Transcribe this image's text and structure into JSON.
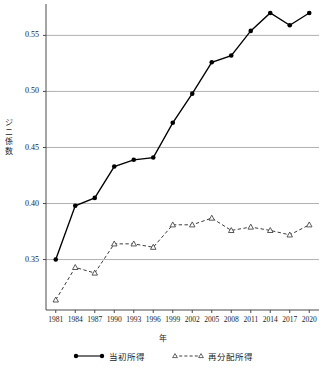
{
  "chart_data": {
    "type": "line",
    "title": "",
    "xlabel": "年",
    "ylabel": "ジニ係数",
    "ylabel_chars": [
      "ジ",
      "ニ",
      "係",
      "数"
    ],
    "categories": [
      "1981",
      "1984",
      "1987",
      "1990",
      "1993",
      "1996",
      "1999",
      "2002",
      "2005",
      "2008",
      "2011",
      "2014",
      "2017",
      "2020"
    ],
    "x_tick_labels": [
      "1981",
      "1984",
      "1987",
      "1990",
      "1993",
      "1996",
      "1999",
      "2002",
      "2005",
      "2008",
      "2011",
      "2014",
      "2017",
      "2020"
    ],
    "y_tick_labels": [
      "0.35",
      "0.40",
      "0.45",
      "0.50",
      "0.55"
    ],
    "y_tick_values": [
      0.35,
      0.4,
      0.45,
      0.5,
      0.55
    ],
    "ylim": [
      0.305,
      0.578
    ],
    "xlim": [
      1979.5,
      2021.5
    ],
    "grid": "horizontal",
    "legend_position": "bottom-center",
    "series": [
      {
        "name": "当初所得",
        "marker": "filled-circle",
        "linestyle": "solid",
        "color": "#000000",
        "values": [
          0.35,
          0.398,
          0.405,
          0.433,
          0.439,
          0.441,
          0.472,
          0.498,
          0.526,
          0.532,
          0.554,
          0.57,
          0.559,
          0.57
        ]
      },
      {
        "name": "再分配所得",
        "marker": "open-triangle",
        "linestyle": "dashed",
        "color": "#3c3c3c",
        "values": [
          0.314,
          0.343,
          0.338,
          0.364,
          0.364,
          0.361,
          0.381,
          0.381,
          0.387,
          0.376,
          0.379,
          0.376,
          0.372,
          0.381
        ]
      }
    ]
  },
  "legend": {
    "items": [
      {
        "label": "当初所得",
        "marker": "filled-circle",
        "linestyle": "solid"
      },
      {
        "label": "再分配所得",
        "marker": "open-triangle",
        "linestyle": "dashed"
      }
    ]
  },
  "colors": {
    "axis": "#4a4a4a",
    "grid": "#a8a8a8",
    "series_solid": "#000000",
    "series_dashed": "#3c3c3c",
    "background": "#ffffff"
  }
}
